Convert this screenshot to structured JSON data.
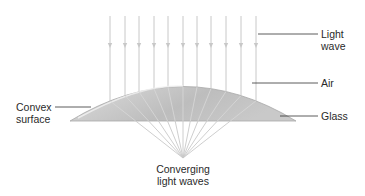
{
  "diagram": {
    "title": "",
    "labels": {
      "light_wave": [
        "Light",
        "wave"
      ],
      "air": "Air",
      "convex_surface": [
        "Convex",
        "surface"
      ],
      "glass": "Glass",
      "converging": [
        "Converging",
        "light waves"
      ]
    },
    "rays": {
      "count": 11,
      "x_positions": [
        110,
        125,
        139,
        154,
        168,
        183,
        197,
        211,
        226,
        241,
        256
      ],
      "focal_point": [
        183,
        158
      ]
    },
    "colors": {
      "ray": "#c8c8c8",
      "lens_fill": "#c2c2c2",
      "lens_highlight": "#e6e6e6",
      "leader_line": "#333333",
      "text": "#2a2a2a"
    }
  }
}
